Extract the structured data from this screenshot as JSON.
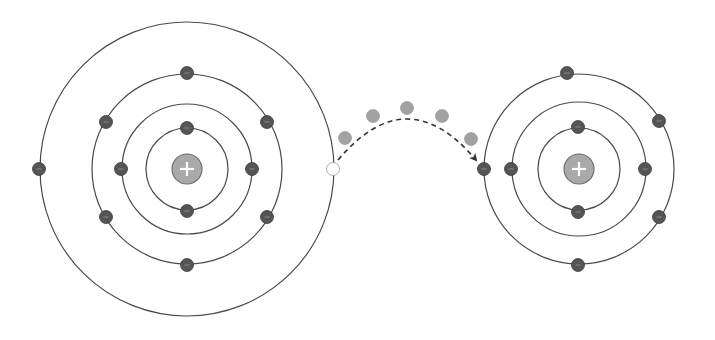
{
  "diagram": {
    "title": "",
    "colors": {
      "background": "#ffffff",
      "orbit": "#4a4a4a",
      "electron": "#555555",
      "electron_glyph": "#8a8a8a",
      "transit_electron": "#a2a2a2",
      "vacancy": "#ffffff",
      "nucleus_fill": "#a9a9a9",
      "nucleus_stroke": "#6e6e6e",
      "nucleus_sign": "#ffffff",
      "arrow": "#333333"
    },
    "nucleus_symbol": "+",
    "electron_symbol": "−",
    "atoms": [
      {
        "id": "donor-atom",
        "center": [
          187,
          169
        ],
        "nucleus_radius": 15,
        "shells": [
          {
            "radius": 41,
            "electrons": [
              [
                187,
                128
              ],
              [
                187,
                211
              ]
            ]
          },
          {
            "radius": 65,
            "electrons": [
              [
                121,
                169
              ],
              [
                252,
                169
              ]
            ]
          },
          {
            "radius": 95,
            "electrons": [
              [
                187,
                73
              ],
              [
                106,
                122
              ],
              [
                267,
                122
              ],
              [
                106,
                217
              ],
              [
                267,
                217
              ],
              [
                187,
                265
              ]
            ]
          },
          {
            "radius": 147,
            "electrons": [
              [
                39,
                169
              ]
            ],
            "vacancy": [
              333,
              169
            ]
          }
        ]
      },
      {
        "id": "acceptor-atom",
        "center": [
          579,
          169
        ],
        "nucleus_radius": 15,
        "shells": [
          {
            "radius": 41,
            "electrons": [
              [
                578,
                127
              ],
              [
                578,
                212
              ]
            ]
          },
          {
            "radius": 67,
            "electrons": [
              [
                511,
                169
              ],
              [
                645,
                169
              ]
            ]
          },
          {
            "radius": 95,
            "electrons": [
              [
                567,
                73
              ],
              [
                659,
                121
              ],
              [
                659,
                217
              ],
              [
                578,
                265
              ],
              [
                484,
                169
              ]
            ]
          }
        ]
      }
    ],
    "transfer": {
      "path_start": [
        338,
        160
      ],
      "path_control": [
        407,
        78
      ],
      "path_end": [
        476,
        160
      ],
      "transit_electrons": [
        [
          345,
          138
        ],
        [
          373,
          116
        ],
        [
          407,
          108
        ],
        [
          442,
          116
        ],
        [
          471,
          139
        ]
      ]
    }
  }
}
